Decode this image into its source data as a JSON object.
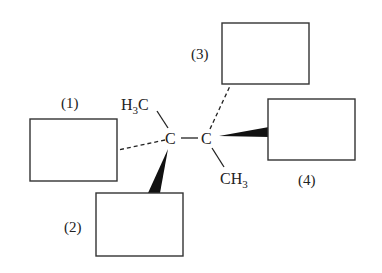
{
  "diagram": {
    "type": "stereochemistry-structure",
    "atoms": {
      "c1": "C",
      "c2": "C",
      "h3c": {
        "main": "H",
        "sub": "3",
        "tail": "C"
      },
      "ch3": {
        "main": "CH",
        "sub": "3"
      }
    },
    "boxes": [
      {
        "id": "1",
        "label": "(1)",
        "bond": "dashed"
      },
      {
        "id": "2",
        "label": "(2)",
        "bond": "wedge"
      },
      {
        "id": "3",
        "label": "(3)",
        "bond": "dashed"
      },
      {
        "id": "4",
        "label": "(4)",
        "bond": "wedge"
      }
    ],
    "colors": {
      "ink": "#222222",
      "background": "#ffffff"
    }
  }
}
